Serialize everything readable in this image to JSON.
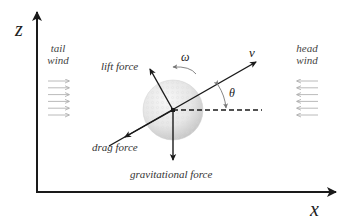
{
  "diagram": {
    "axes": {
      "vertical_label": "z",
      "horizontal_label": "x"
    },
    "wind": {
      "tail": {
        "line1": "tail",
        "line2": "wind",
        "direction": "right",
        "arrow_count": 6
      },
      "head": {
        "line1": "head",
        "line2": "wind",
        "direction": "left",
        "arrow_count": 6
      }
    },
    "forces": {
      "lift": "lift force",
      "drag": "drag force",
      "gravity": "gravitational force"
    },
    "symbols": {
      "velocity": "v",
      "angle": "θ",
      "spin": "ω"
    },
    "colors": {
      "line": "#1a1a1a",
      "wind_arrow": "#a8a8a8",
      "ball_light": "#f4f4f4",
      "ball_dark": "#c8c8c8"
    }
  }
}
